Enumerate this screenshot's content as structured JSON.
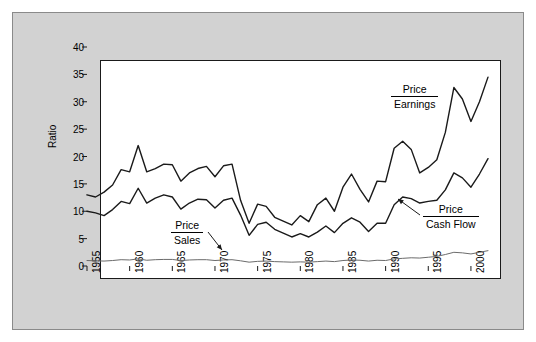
{
  "chart_data": {
    "type": "line",
    "title": "",
    "subtitle": "",
    "xlabel": "",
    "ylabel": "Ratio",
    "xlim": [
      1955,
      2002
    ],
    "ylim": [
      0,
      40
    ],
    "grid": false,
    "legend_position": "inline-annotations",
    "ytick_labels": [
      "0",
      "5",
      "10",
      "15",
      "20",
      "25",
      "30",
      "35",
      "40"
    ],
    "ytick_values": [
      0,
      5,
      10,
      15,
      20,
      25,
      30,
      35,
      40
    ],
    "xtick_labels": [
      "1955",
      "1960",
      "1965",
      "1970",
      "1975",
      "1980",
      "1985",
      "1990",
      "1995",
      "2000"
    ],
    "xtick_values": [
      1955,
      1960,
      1965,
      1970,
      1975,
      1980,
      1985,
      1990,
      1995,
      2000
    ],
    "x": [
      1955,
      1956,
      1957,
      1958,
      1959,
      1960,
      1961,
      1962,
      1963,
      1964,
      1965,
      1966,
      1967,
      1968,
      1969,
      1970,
      1971,
      1972,
      1973,
      1974,
      1975,
      1976,
      1977,
      1978,
      1979,
      1980,
      1981,
      1982,
      1983,
      1984,
      1985,
      1986,
      1987,
      1988,
      1989,
      1990,
      1991,
      1992,
      1993,
      1994,
      1995,
      1996,
      1997,
      1998,
      1999,
      2000,
      2001,
      2002
    ],
    "series": [
      {
        "name": "Price / Earnings",
        "label_numerator": "Price",
        "label_denominator": "Earnings",
        "color": "#1a1a1a",
        "values": [
          13.0,
          12.6,
          13.5,
          14.8,
          17.6,
          17.2,
          22.0,
          17.2,
          17.8,
          18.6,
          18.5,
          15.5,
          17.0,
          17.8,
          18.2,
          16.3,
          18.3,
          18.6,
          12.0,
          7.8,
          11.3,
          10.9,
          8.9,
          8.2,
          7.5,
          9.2,
          8.1,
          11.2,
          12.4,
          10.0,
          14.4,
          16.8,
          14.0,
          11.7,
          15.5,
          15.4,
          21.5,
          22.8,
          21.3,
          17.0,
          18.0,
          19.4,
          24.4,
          32.6,
          30.5,
          26.4,
          30.0,
          34.5
        ]
      },
      {
        "name": "Price / Cash Flow",
        "label_numerator": "Price",
        "label_denominator": "Cash Flow",
        "color": "#1a1a1a",
        "values": [
          10.0,
          9.7,
          9.2,
          10.3,
          11.8,
          11.4,
          14.2,
          11.5,
          12.4,
          13.0,
          12.6,
          10.4,
          11.5,
          12.2,
          12.1,
          10.6,
          12.0,
          12.4,
          9.3,
          5.6,
          7.6,
          8.0,
          6.7,
          6.0,
          5.3,
          5.9,
          5.3,
          6.2,
          7.3,
          6.1,
          7.8,
          8.8,
          8.0,
          6.3,
          7.8,
          7.8,
          11.2,
          12.6,
          12.3,
          11.5,
          11.8,
          12.0,
          13.9,
          17.0,
          16.1,
          14.4,
          16.8,
          19.6
        ]
      },
      {
        "name": "Price / Sales",
        "label_numerator": "Price",
        "label_denominator": "Sales",
        "color": "#6b6b6b",
        "values": [
          1.0,
          0.95,
          0.9,
          1.0,
          1.15,
          1.1,
          1.3,
          1.05,
          1.15,
          1.2,
          1.2,
          1.0,
          1.1,
          1.15,
          1.15,
          1.0,
          1.1,
          1.15,
          0.95,
          0.7,
          0.85,
          0.9,
          0.8,
          0.75,
          0.7,
          0.75,
          0.7,
          0.8,
          0.9,
          0.8,
          1.0,
          1.1,
          1.05,
          0.9,
          1.05,
          1.0,
          1.3,
          1.4,
          1.5,
          1.45,
          1.6,
          1.75,
          2.1,
          2.5,
          2.4,
          2.2,
          2.5,
          2.8
        ]
      }
    ],
    "annotations": [
      {
        "id": "pe-label",
        "numerator": "Price",
        "denominator": "Earnings",
        "x_px": 390,
        "y_px": 82,
        "leader": false
      },
      {
        "id": "pcf-label",
        "numerator": "Price",
        "denominator": "Cash Flow",
        "x_px": 422,
        "y_px": 202,
        "leader": true
      },
      {
        "id": "ps-label",
        "numerator": "Price",
        "denominator": "Sales",
        "x_px": 170,
        "y_px": 218,
        "leader": true
      }
    ]
  },
  "axes": {
    "y_axis_title": "Ratio"
  }
}
